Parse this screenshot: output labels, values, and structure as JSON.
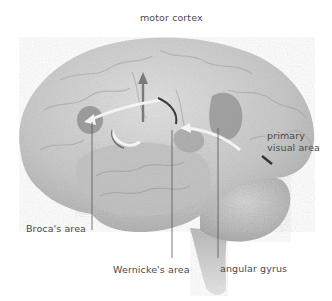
{
  "diagram": {
    "labels": {
      "motor_cortex": "motor cortex",
      "primary_visual_line1": "primary",
      "primary_visual_line2": "visual area",
      "brocas_area": "Broca's area",
      "wernickes_area": "Wernicke's area",
      "angular_gyrus": "angular gyrus"
    },
    "colors": {
      "background": "#ffffff",
      "brain_light": "#d9d9d9",
      "brain_mid": "#b8b8b8",
      "brain_dark": "#8a8a8a",
      "label_text": "#4a4a4a",
      "leader_line": "#555555",
      "arrow": "#f4f4f4"
    }
  }
}
